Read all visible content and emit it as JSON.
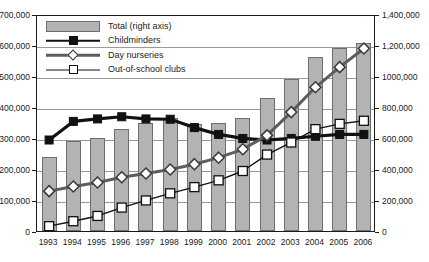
{
  "chart_data": {
    "type": "bar",
    "title": "",
    "subtitle": "",
    "xlabel": "",
    "ylabel": "",
    "categories": [
      "1993",
      "1994",
      "1995",
      "1996",
      "1997",
      "1998",
      "1999",
      "2000",
      "2001",
      "2002",
      "2003",
      "2004",
      "2005",
      "2006"
    ],
    "left_axis": {
      "label": "",
      "ylim": [
        0,
        700000
      ],
      "ticks": [
        0,
        100000,
        200000,
        300000,
        400000,
        500000,
        600000,
        700000
      ],
      "tick_labels": [
        "0",
        "100,000",
        "200,000",
        "300,000",
        "400,000",
        "500,000",
        "600,000",
        "700,000"
      ]
    },
    "right_axis": {
      "label": "",
      "ylim": [
        0,
        1400000
      ],
      "ticks": [
        0,
        200000,
        400000,
        600000,
        800000,
        1000000,
        1200000,
        1400000
      ],
      "tick_labels": [
        "0",
        "200,000",
        "400,000",
        "600,000",
        "800,000",
        "1000,000",
        "1,200,000",
        "1,400,000"
      ]
    },
    "grid": true,
    "legend_position": "top-left",
    "series": [
      {
        "name": "Total (right axis)",
        "type": "bar",
        "axis": "right",
        "color": "#b3b3b3",
        "edge_color": "#6e6e6e",
        "values": [
          480000,
          580000,
          600000,
          660000,
          700000,
          730000,
          690000,
          700000,
          730000,
          860000,
          980000,
          1120000,
          1180000,
          1210000
        ]
      },
      {
        "name": "Childminders",
        "type": "line",
        "axis": "left",
        "color": "#111111",
        "marker": "filled-square",
        "values": [
          300000,
          360000,
          368000,
          375000,
          368000,
          367000,
          340000,
          318000,
          305000,
          300000,
          305000,
          312000,
          318000,
          318000
        ]
      },
      {
        "name": "Day nurseries",
        "type": "line",
        "axis": "left",
        "color": "#5d5d5d",
        "marker": "open-diamond",
        "values": [
          135000,
          150000,
          163000,
          180000,
          192000,
          205000,
          222000,
          243000,
          270000,
          315000,
          390000,
          470000,
          535000,
          595000
        ]
      },
      {
        "name": "Out-of-school clubs",
        "type": "line",
        "axis": "left",
        "color": "#111111",
        "marker": "open-square",
        "values": [
          22000,
          38000,
          55000,
          82000,
          105000,
          128000,
          148000,
          170000,
          200000,
          253000,
          292000,
          335000,
          352000,
          362000
        ]
      }
    ]
  },
  "legend": {
    "items": [
      {
        "label": "Total (right axis)",
        "key": "bar-swatch"
      },
      {
        "label": "Childminders",
        "key": "line-filled-square"
      },
      {
        "label": "Day nurseries",
        "key": "line-open-diamond"
      },
      {
        "label": "Out-of-school clubs",
        "key": "line-open-square"
      }
    ]
  }
}
